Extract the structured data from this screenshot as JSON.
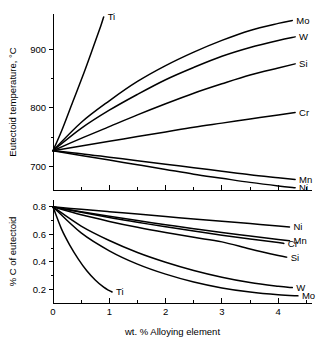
{
  "figure": {
    "background": "#ffffff",
    "ink": "#000000"
  },
  "chart_data": [
    {
      "id": "eutectoid-temperature",
      "type": "line",
      "title": "",
      "xlabel": "",
      "ylabel": "Eutectoid temperature, °C",
      "xlim": [
        0,
        4.6
      ],
      "ylim": [
        660,
        960
      ],
      "xticks": [
        0,
        1,
        2,
        3,
        4
      ],
      "xticklabels": [
        "",
        "",
        "",
        "",
        ""
      ],
      "xminorticks": [
        0.5,
        1.5,
        2.5,
        3.5,
        4.5
      ],
      "yticks": [
        700,
        800,
        900
      ],
      "yticklabels": [
        "700",
        "800",
        "900"
      ],
      "yminorticks": [
        750,
        850
      ],
      "grid": false,
      "legend_position": "right-of-curve-ends",
      "origin_value": 727,
      "series": [
        {
          "name": "Ti",
          "label": "Ti",
          "points": [
            [
              0,
              727
            ],
            [
              0.15,
              760
            ],
            [
              0.35,
              810
            ],
            [
              0.55,
              860
            ],
            [
              0.72,
              905
            ],
            [
              0.85,
              940
            ],
            [
              0.9,
              955
            ]
          ]
        },
        {
          "name": "Mo",
          "label": "Mo",
          "points": [
            [
              0,
              727
            ],
            [
              0.5,
              775
            ],
            [
              1.0,
              812
            ],
            [
              1.5,
              845
            ],
            [
              2.0,
              872
            ],
            [
              2.5,
              895
            ],
            [
              3.0,
              915
            ],
            [
              3.5,
              932
            ],
            [
              4.0,
              944
            ],
            [
              4.25,
              949
            ]
          ]
        },
        {
          "name": "W",
          "label": "W",
          "points": [
            [
              0,
              727
            ],
            [
              0.5,
              765
            ],
            [
              1.0,
              796
            ],
            [
              1.5,
              823
            ],
            [
              2.0,
              848
            ],
            [
              2.5,
              869
            ],
            [
              3.0,
              888
            ],
            [
              3.5,
              903
            ],
            [
              4.0,
              915
            ],
            [
              4.3,
              921
            ]
          ]
        },
        {
          "name": "Si",
          "label": "Si",
          "points": [
            [
              0,
              727
            ],
            [
              0.5,
              748
            ],
            [
              1.0,
              768
            ],
            [
              1.5,
              788
            ],
            [
              2.0,
              807
            ],
            [
              2.5,
              825
            ],
            [
              3.0,
              841
            ],
            [
              3.5,
              856
            ],
            [
              4.0,
              868
            ],
            [
              4.3,
              875
            ]
          ]
        },
        {
          "name": "Cr",
          "label": "Cr",
          "points": [
            [
              0,
              727
            ],
            [
              0.5,
              735
            ],
            [
              1.0,
              743
            ],
            [
              1.5,
              751
            ],
            [
              2.0,
              759
            ],
            [
              2.5,
              767
            ],
            [
              3.0,
              774
            ],
            [
              3.5,
              781
            ],
            [
              4.0,
              788
            ],
            [
              4.3,
              792
            ]
          ]
        },
        {
          "name": "Mn",
          "label": "Mn",
          "points": [
            [
              0,
              727
            ],
            [
              0.5,
              722
            ],
            [
              1.0,
              716
            ],
            [
              1.5,
              710
            ],
            [
              2.0,
              704
            ],
            [
              2.5,
              698
            ],
            [
              3.0,
              692
            ],
            [
              3.5,
              686
            ],
            [
              4.0,
              681
            ],
            [
              4.3,
              678
            ]
          ]
        },
        {
          "name": "Ni",
          "label": "Ni",
          "points": [
            [
              0,
              727
            ],
            [
              0.5,
              719
            ],
            [
              1.0,
              711
            ],
            [
              1.5,
              703
            ],
            [
              2.0,
              695
            ],
            [
              2.5,
              687
            ],
            [
              3.0,
              680
            ],
            [
              3.5,
              673
            ],
            [
              4.0,
              667
            ],
            [
              4.3,
              664
            ]
          ]
        }
      ]
    },
    {
      "id": "percent-carbon-of-eutectoid",
      "type": "line",
      "title": "",
      "xlabel": "wt. % Alloying element",
      "ylabel": "% C of eutectoid",
      "xlim": [
        0,
        4.6
      ],
      "ylim": [
        0.1,
        0.85
      ],
      "xticks": [
        0,
        1,
        2,
        3,
        4
      ],
      "xticklabels": [
        "0",
        "1",
        "2",
        "3",
        "4"
      ],
      "xminorticks": [
        0.5,
        1.5,
        2.5,
        3.5,
        4.5
      ],
      "yticks": [
        0.2,
        0.4,
        0.6,
        0.8
      ],
      "yticklabels": [
        "0.2",
        "0.4",
        "0.6",
        "0.8"
      ],
      "yminorticks": [
        0.3,
        0.5,
        0.7
      ],
      "grid": false,
      "legend_position": "right-of-curve-ends",
      "origin_value": 0.8,
      "series": [
        {
          "name": "Ni",
          "label": "Ni",
          "points": [
            [
              0,
              0.8
            ],
            [
              0.5,
              0.782
            ],
            [
              1.0,
              0.765
            ],
            [
              1.5,
              0.748
            ],
            [
              2.0,
              0.73
            ],
            [
              2.5,
              0.712
            ],
            [
              3.0,
              0.695
            ],
            [
              3.5,
              0.678
            ],
            [
              4.0,
              0.66
            ],
            [
              4.2,
              0.653
            ]
          ]
        },
        {
          "name": "Mn",
          "label": "Mn",
          "points": [
            [
              0,
              0.8
            ],
            [
              0.5,
              0.765
            ],
            [
              1.0,
              0.732
            ],
            [
              1.5,
              0.7
            ],
            [
              2.0,
              0.67
            ],
            [
              2.5,
              0.641
            ],
            [
              3.0,
              0.614
            ],
            [
              3.5,
              0.588
            ],
            [
              4.0,
              0.563
            ],
            [
              4.2,
              0.553
            ]
          ]
        },
        {
          "name": "Cr",
          "label": "Cr",
          "points": [
            [
              0,
              0.8
            ],
            [
              0.5,
              0.76
            ],
            [
              1.0,
              0.722
            ],
            [
              1.5,
              0.688
            ],
            [
              2.0,
              0.655
            ],
            [
              2.5,
              0.624
            ],
            [
              3.0,
              0.594
            ],
            [
              3.5,
              0.566
            ],
            [
              4.0,
              0.54
            ],
            [
              4.1,
              0.534
            ]
          ]
        },
        {
          "name": "Si",
          "label": "Si",
          "points": [
            [
              0,
              0.8
            ],
            [
              0.5,
              0.742
            ],
            [
              1.0,
              0.694
            ],
            [
              1.5,
              0.651
            ],
            [
              2.0,
              0.613
            ],
            [
              2.5,
              0.578
            ],
            [
              3.0,
              0.545
            ],
            [
              3.5,
              0.493
            ],
            [
              4.0,
              0.446
            ],
            [
              4.15,
              0.434
            ]
          ]
        },
        {
          "name": "W",
          "label": "W",
          "points": [
            [
              0,
              0.8
            ],
            [
              0.5,
              0.66
            ],
            [
              1.0,
              0.555
            ],
            [
              1.5,
              0.468
            ],
            [
              2.0,
              0.397
            ],
            [
              2.5,
              0.337
            ],
            [
              3.0,
              0.288
            ],
            [
              3.5,
              0.249
            ],
            [
              4.0,
              0.222
            ],
            [
              4.25,
              0.212
            ]
          ]
        },
        {
          "name": "Mo",
          "label": "Mo",
          "points": [
            [
              0,
              0.8
            ],
            [
              0.5,
              0.61
            ],
            [
              1.0,
              0.48
            ],
            [
              1.5,
              0.383
            ],
            [
              2.0,
              0.31
            ],
            [
              2.5,
              0.253
            ],
            [
              3.0,
              0.21
            ],
            [
              3.5,
              0.18
            ],
            [
              4.0,
              0.16
            ],
            [
              4.35,
              0.152
            ]
          ]
        },
        {
          "name": "Ti",
          "label": "Ti",
          "points": [
            [
              0,
              0.8
            ],
            [
              0.15,
              0.64
            ],
            [
              0.3,
              0.52
            ],
            [
              0.45,
              0.42
            ],
            [
              0.6,
              0.335
            ],
            [
              0.75,
              0.268
            ],
            [
              0.9,
              0.215
            ],
            [
              1.0,
              0.19
            ],
            [
              1.05,
              0.18
            ]
          ]
        }
      ]
    }
  ]
}
